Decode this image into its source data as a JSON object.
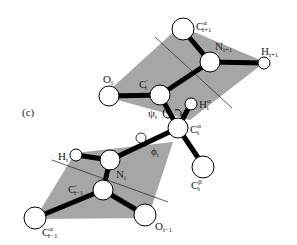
{
  "figure": {
    "panel_label": "(c)",
    "colors": {
      "plane": "#a6a6a6",
      "bond": "#000000",
      "atom_fill": "#ffffff",
      "atom_stroke": "#000000",
      "axis_line": "#333333"
    },
    "planes": [
      {
        "name": "peptide-plane-upper",
        "points": "103,96 180,26 265,62 190,120"
      },
      {
        "name": "peptide-plane-lower",
        "points": "35,219 75,153 173,142 148,218"
      }
    ],
    "axis_lines": [
      {
        "name": "upper-plane-axis",
        "x1": 155,
        "y1": 37,
        "x2": 232,
        "y2": 108
      },
      {
        "name": "lower-plane-axis",
        "x1": 52,
        "y1": 160,
        "x2": 168,
        "y2": 202
      }
    ],
    "bonds": [
      {
        "name": "bond-Oi-Ci",
        "x1": 109,
        "y1": 96,
        "x2": 160,
        "y2": 95
      },
      {
        "name": "bond-Ci-Ni1",
        "x1": 160,
        "y1": 95,
        "x2": 210,
        "y2": 62
      },
      {
        "name": "bond-Ni1-Ca1",
        "x1": 210,
        "y1": 62,
        "x2": 183,
        "y2": 30
      },
      {
        "name": "bond-Ni1-Hi1",
        "x1": 210,
        "y1": 62,
        "x2": 264,
        "y2": 63
      },
      {
        "name": "bond-Ci-Cai",
        "x1": 160,
        "y1": 95,
        "x2": 178,
        "y2": 128
      },
      {
        "name": "bond-Cai-Hai",
        "x1": 178,
        "y1": 128,
        "x2": 190,
        "y2": 105
      },
      {
        "name": "bond-Cai-Cbi",
        "x1": 178,
        "y1": 128,
        "x2": 203,
        "y2": 165
      },
      {
        "name": "bond-Cai-Ni",
        "x1": 178,
        "y1": 128,
        "x2": 110,
        "y2": 160
      },
      {
        "name": "bond-Ni-Hi",
        "x1": 110,
        "y1": 160,
        "x2": 76,
        "y2": 155
      },
      {
        "name": "bond-Ni-Ci-1",
        "x1": 110,
        "y1": 160,
        "x2": 103,
        "y2": 190
      },
      {
        "name": "bond-Ci-1-Ca-1",
        "x1": 103,
        "y1": 190,
        "x2": 35,
        "y2": 218
      },
      {
        "name": "bond-Ci-1-Oi-1",
        "x1": 103,
        "y1": 190,
        "x2": 145,
        "y2": 215
      }
    ],
    "atoms": [
      {
        "name": "atom-O-i",
        "cx": 109,
        "cy": 96,
        "r": 10
      },
      {
        "name": "atom-C-prime-i",
        "cx": 160,
        "cy": 95,
        "r": 10
      },
      {
        "name": "atom-C-alpha-i+1",
        "cx": 183,
        "cy": 29,
        "r": 11
      },
      {
        "name": "atom-N-i+1",
        "cx": 210,
        "cy": 62,
        "r": 10
      },
      {
        "name": "atom-H-i+1",
        "cx": 264,
        "cy": 63,
        "r": 6
      },
      {
        "name": "atom-C-alpha-i",
        "cx": 178,
        "cy": 128,
        "r": 10
      },
      {
        "name": "atom-H-alpha-i",
        "cx": 191,
        "cy": 104,
        "r": 6
      },
      {
        "name": "atom-C-beta-i",
        "cx": 203,
        "cy": 167,
        "r": 11
      },
      {
        "name": "atom-H-i",
        "cx": 76,
        "cy": 155,
        "r": 6
      },
      {
        "name": "atom-N-i",
        "cx": 110,
        "cy": 160,
        "r": 10
      },
      {
        "name": "atom-C-prime-i-1",
        "cx": 103,
        "cy": 190,
        "r": 10
      },
      {
        "name": "atom-C-alpha-i-1",
        "cx": 35,
        "cy": 218,
        "r": 11
      },
      {
        "name": "atom-O-i-1",
        "cx": 145,
        "cy": 215,
        "r": 11
      }
    ],
    "labels": {
      "O_i": {
        "main": "O",
        "sub": "i",
        "sup": ""
      },
      "C_prime_i": {
        "main": "C",
        "sub": "i",
        "sup": "′"
      },
      "C_alpha_i1": {
        "main": "C",
        "sub": "i+1",
        "sup": "α"
      },
      "N_i1": {
        "main": "N",
        "sub": "i+1",
        "sup": ""
      },
      "H_i1": {
        "main": "H",
        "sub": "i+1",
        "sup": ""
      },
      "H_alpha_i": {
        "main": "H",
        "sub": "i",
        "sup": "α"
      },
      "C_alpha_i": {
        "main": "C",
        "sub": "i",
        "sup": "α"
      },
      "C_beta_i": {
        "main": "C",
        "sub": "i",
        "sup": "β"
      },
      "H_i": {
        "main": "H",
        "sub": "i",
        "sup": ""
      },
      "N_i": {
        "main": "N",
        "sub": "i",
        "sup": ""
      },
      "C_prime_i_1": {
        "main": "C",
        "sub": "i−1",
        "sup": "′"
      },
      "C_alpha_i_1": {
        "main": "C",
        "sub": "i−1",
        "sup": "α"
      },
      "O_i_1": {
        "main": "O",
        "sub": "i−1",
        "sup": ""
      },
      "psi": {
        "main": "ψ",
        "sub": "i",
        "sup": ""
      },
      "phi": {
        "main": "ϕ",
        "sub": "i",
        "sup": ""
      }
    }
  }
}
